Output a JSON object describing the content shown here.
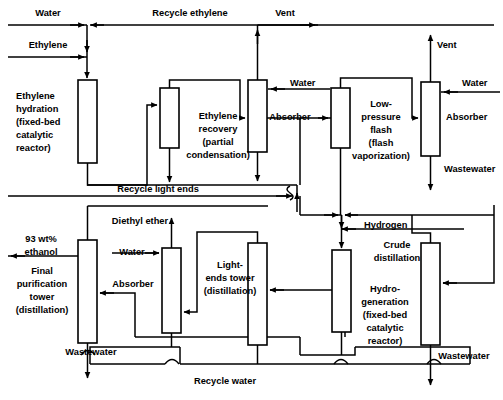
{
  "diagram": {
    "type": "process-flow-diagram",
    "colors": {
      "line": "#000000",
      "box_fill": "#ffffff",
      "background": "#ffffff"
    },
    "units": [
      {
        "id": "ethylene-hydration-reactor",
        "label": "Ethylene\nhydration\n(fixed-bed\ncatalytic\nreactor)",
        "lines": [
          "Ethylene",
          "hydration",
          "(fixed-bed",
          "catalytic",
          "reactor)"
        ]
      },
      {
        "id": "ethylene-recovery",
        "label": "Ethylene recovery (partial condensation)",
        "lines": [
          "Ethylene",
          "recovery",
          "(partial",
          "condensation)"
        ]
      },
      {
        "id": "absorber-top-1",
        "label": "Absorber",
        "lines": [
          "Absorber"
        ]
      },
      {
        "id": "low-pressure-flash",
        "label": "Low-pressure flash (flash vaporization)",
        "lines": [
          "Low-",
          "pressure",
          "flash",
          "(flash",
          "vaporization)"
        ]
      },
      {
        "id": "absorber-top-2",
        "label": "Absorber",
        "lines": [
          "Absorber"
        ]
      },
      {
        "id": "final-purification-tower",
        "label": "Final purification tower (distillation)",
        "lines": [
          "Final",
          "purification",
          "tower",
          "(distillation)"
        ]
      },
      {
        "id": "absorber-bottom",
        "label": "Absorber",
        "lines": [
          "Absorber"
        ]
      },
      {
        "id": "light-ends-tower",
        "label": "Light-ends tower (distillation)",
        "lines": [
          "Light-",
          "ends tower",
          "(distillation)"
        ]
      },
      {
        "id": "hydrogenation-reactor",
        "label": "Hydrogeneration (fixed-bed catalytic reactor)",
        "lines": [
          "Hydro-",
          "generation",
          "(fixed-bed",
          "catalytic",
          "reactor)"
        ]
      },
      {
        "id": "crude-distillation",
        "label": "Crude distillation",
        "lines": [
          "Crude",
          "distillation"
        ]
      }
    ],
    "streams": [
      {
        "id": "water-feed-top",
        "label": "Water"
      },
      {
        "id": "ethylene-feed",
        "label": "Ethylene"
      },
      {
        "id": "recycle-ethylene",
        "label": "Recycle ethylene"
      },
      {
        "id": "vent-1",
        "label": "Vent"
      },
      {
        "id": "water-absorber-1",
        "label": "Water"
      },
      {
        "id": "vent-2",
        "label": "Vent"
      },
      {
        "id": "water-absorber-2",
        "label": "Water"
      },
      {
        "id": "wastewater-absorber-2",
        "label": "Wastewater"
      },
      {
        "id": "recycle-light-ends",
        "label": "Recycle light ends"
      },
      {
        "id": "diethyl-ether",
        "label": "Diethyl ether"
      },
      {
        "id": "water-absorber-bottom",
        "label": "Water"
      },
      {
        "id": "hydrogen-feed",
        "label": "Hydrogen"
      },
      {
        "id": "ethanol-product",
        "label": "93 wt% ethanol",
        "lines": [
          "93 wt%",
          "ethanol"
        ]
      },
      {
        "id": "wastewater-purification",
        "label": "Wastewater"
      },
      {
        "id": "wastewater-crude-distillation",
        "label": "Wastewater"
      },
      {
        "id": "recycle-water",
        "label": "Recycle water"
      }
    ],
    "labels": {
      "water_top": "Water",
      "ethylene": "Ethylene",
      "recycle_ethylene": "Recycle ethylene",
      "vent_1": "Vent",
      "ethylene_hydration_l1": "Ethylene",
      "ethylene_hydration_l2": "hydration",
      "ethylene_hydration_l3": "(fixed-bed",
      "ethylene_hydration_l4": "catalytic",
      "ethylene_hydration_l5": "reactor)",
      "ethylene_recovery_l1": "Ethylene",
      "ethylene_recovery_l2": "recovery",
      "ethylene_recovery_l3": "(partial",
      "ethylene_recovery_l4": "condensation)",
      "water_abs1": "Water",
      "absorber_1": "Absorber",
      "lp_flash_l1": "Low-",
      "lp_flash_l2": "pressure",
      "lp_flash_l3": "flash",
      "lp_flash_l4": "(flash",
      "lp_flash_l5": "vaporization)",
      "vent_2": "Vent",
      "water_abs2": "Water",
      "absorber_2": "Absorber",
      "wastewater_abs2": "Wastewater",
      "recycle_light_ends": "Recycle light ends",
      "diethyl_ether": "Diethyl ether",
      "ethanol_l1": "93 wt%",
      "ethanol_l2": "ethanol",
      "water_abs3": "Water",
      "absorber_3": "Absorber",
      "final_tower_l1": "Final",
      "final_tower_l2": "purification",
      "final_tower_l3": "tower",
      "final_tower_l4": "(distillation)",
      "light_ends_l1": "Light-",
      "light_ends_l2": "ends tower",
      "light_ends_l3": "(distillation)",
      "hydrogen": "Hydrogen",
      "crude_dist_l1": "Crude",
      "crude_dist_l2": "distillation",
      "hydrogen_unit_l1": "Hydro-",
      "hydrogen_unit_l2": "generation",
      "hydrogen_unit_l3": "(fixed-bed",
      "hydrogen_unit_l4": "catalytic",
      "hydrogen_unit_l5": "reactor)",
      "wastewater_left": "Wastewater",
      "wastewater_right": "Wastewater",
      "recycle_water": "Recycle water"
    }
  }
}
